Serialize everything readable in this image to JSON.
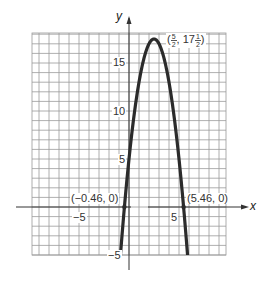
{
  "chart_data": {
    "type": "line",
    "title": "",
    "equation": "y = -2x^2 + 10x + 5",
    "xlabel": "x",
    "ylabel": "y",
    "xlim": [
      -10,
      9.5
    ],
    "ylim": [
      -5,
      18
    ],
    "grid": true,
    "x_ticks_labeled": [
      -5,
      5
    ],
    "y_ticks_labeled": [
      -5,
      5,
      10,
      15
    ],
    "series": [
      {
        "name": "parabola",
        "x": [
          -0.5,
          -0.46,
          0,
          0.5,
          1,
          1.5,
          2,
          2.5,
          3,
          3.5,
          4,
          4.5,
          5,
          5.46,
          5.5
        ],
        "y": [
          -0.5,
          0,
          5,
          9.5,
          13,
          15.5,
          17,
          17.5,
          17,
          15.5,
          13,
          9.5,
          5,
          0,
          -0.5
        ]
      }
    ],
    "annotations": [
      {
        "text": "(5/2, 17 1/2)",
        "x": 2.5,
        "y": 17.5,
        "kind": "vertex"
      },
      {
        "text": "(−0.46, 0)",
        "x": -0.46,
        "y": 0,
        "kind": "root"
      },
      {
        "text": "(5.46, 0)",
        "x": 5.46,
        "y": 0,
        "kind": "root"
      }
    ]
  },
  "labels": {
    "x_axis": "x",
    "y_axis": "y",
    "tick_y_15": "15",
    "tick_y_10": "10",
    "tick_y_5": "5",
    "tick_y_neg5": "−5",
    "tick_x_neg5": "−5",
    "tick_x_5": "5",
    "root_left": "(−0.46, 0)",
    "root_right": "(5.46, 0)",
    "vertex_open": "(",
    "vertex_x_num": "5",
    "vertex_x_den": "2",
    "vertex_sep": ", 17",
    "vertex_y_num": "1",
    "vertex_y_den": "2",
    "vertex_close": ")"
  },
  "colors": {
    "grid": "#9a9a9a",
    "axis": "#333333",
    "curve": "#2b2b2b",
    "text": "#333333"
  }
}
